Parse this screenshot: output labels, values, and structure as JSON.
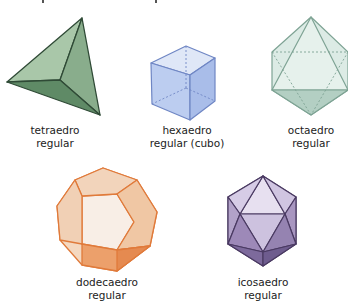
{
  "solids": [
    {
      "id": "tetraedro",
      "line1": "tetraedro",
      "line2": "regular",
      "color": "#6f9a77"
    },
    {
      "id": "hexaedro",
      "line1": "hexaedro",
      "line2": "regular (cubo)",
      "color": "#9db6e8"
    },
    {
      "id": "octaedro",
      "line1": "octaedro",
      "line2": "regular",
      "color": "#a9cbbe"
    },
    {
      "id": "dodecaedro",
      "line1": "dodecaedro",
      "line2": "regular",
      "color": "#e8894a"
    },
    {
      "id": "icosaedro",
      "line1": "icosaedro",
      "line2": "regular",
      "color": "#8a76a6"
    }
  ]
}
